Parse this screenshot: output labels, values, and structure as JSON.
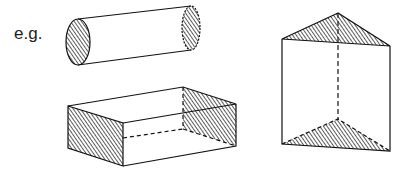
{
  "label": "e.g.",
  "shapes": [
    {
      "name": "cylinder",
      "shaded_faces": [
        "left-end",
        "right-end"
      ]
    },
    {
      "name": "rectangular-prism",
      "shaded_faces": [
        "left-end",
        "right-end"
      ]
    },
    {
      "name": "triangular-prism",
      "shaded_faces": [
        "top",
        "bottom"
      ]
    }
  ],
  "colors": {
    "line": "#111111",
    "hatch": "#333333",
    "background": "#ffffff"
  }
}
